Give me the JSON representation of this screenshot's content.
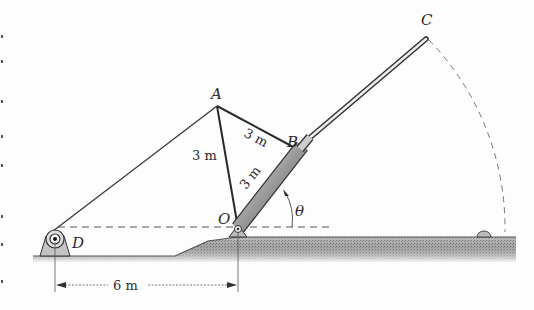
{
  "figure": {
    "points": {
      "A": {
        "label": "A"
      },
      "B": {
        "label": "B"
      },
      "C": {
        "label": "C"
      },
      "D": {
        "label": "D"
      },
      "O": {
        "label": "O"
      }
    },
    "angle_label": "θ",
    "dimensions": {
      "AB": "3 m",
      "AO": "3 m",
      "OB": "3 m",
      "DO": "6 m"
    },
    "colors": {
      "line": "#3a3a3a",
      "ground": "#9a9a9a",
      "cylinder": "#8c8c8c"
    }
  }
}
